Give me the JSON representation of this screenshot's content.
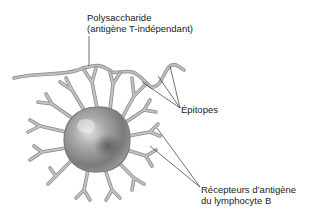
{
  "diagram": {
    "type": "biology-illustration",
    "labels": {
      "polysaccharide_line1": "Polysaccharide",
      "polysaccharide_line2": "(antigène T-indépendant)",
      "epitopes": "Épitopes",
      "receptors_line1": "Récepteurs d’antigène",
      "receptors_line2": "du lymphocyte B"
    },
    "colors": {
      "background": "#ffffff",
      "cell_body": "#9a9a9a",
      "cell_highlight": "#d6d6d6",
      "cell_shadow": "#5e5e5e",
      "receptor": "#b4b4b4",
      "receptor_outline": "#8a8a8a",
      "leader_line": "#333333",
      "text": "#222222"
    }
  }
}
